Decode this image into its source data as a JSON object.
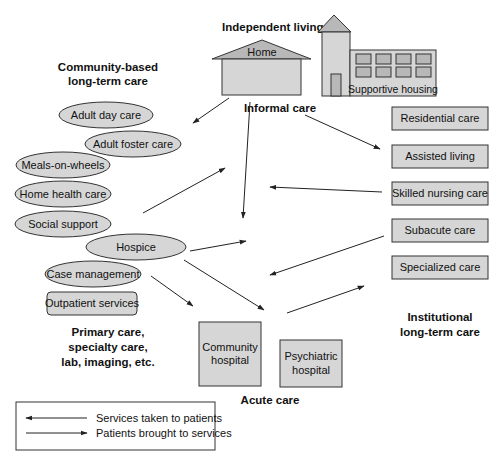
{
  "diagram": {
    "groups": {
      "independent_living": {
        "heading": "Independent living",
        "home_label": "Home",
        "supportive_housing_label": "Supportive housing",
        "informal_care_label": "Informal care"
      },
      "community_based": {
        "heading_line1": "Community-based",
        "heading_line2": "long-term care",
        "items": [
          {
            "label": "Adult day care",
            "shape": "ellipse"
          },
          {
            "label": "Adult foster care",
            "shape": "ellipse"
          },
          {
            "label": "Meals-on-wheels",
            "shape": "ellipse"
          },
          {
            "label": "Home health care",
            "shape": "ellipse"
          },
          {
            "label": "Social support",
            "shape": "ellipse"
          },
          {
            "label": "Hospice",
            "shape": "ellipse"
          },
          {
            "label": "Case management",
            "shape": "ellipse"
          },
          {
            "label": "Outpatient services",
            "shape": "rounded-rect"
          }
        ]
      },
      "primary_care": {
        "line1": "Primary care,",
        "line2": "specialty care,",
        "line3": "lab, imaging, etc."
      },
      "acute_care": {
        "heading": "Acute care",
        "community_hospital_line1": "Community",
        "community_hospital_line2": "hospital",
        "psychiatric_hospital_line1": "Psychiatric",
        "psychiatric_hospital_line2": "hospital"
      },
      "institutional": {
        "heading_line1": "Institutional",
        "heading_line2": "long-term care",
        "items": [
          {
            "label": "Residential care"
          },
          {
            "label": "Assisted living"
          },
          {
            "label": "Skilled nursing care"
          },
          {
            "label": "Subacute care"
          },
          {
            "label": "Specialized care"
          }
        ]
      }
    },
    "legend": {
      "items": [
        {
          "label": "Services taken to patients",
          "arrow": "left"
        },
        {
          "label": "Patients brought to services",
          "arrow": "right"
        }
      ]
    },
    "colors": {
      "fill": "#d6d6d6",
      "roof": "#b8b8b8",
      "stroke": "#333333"
    }
  }
}
